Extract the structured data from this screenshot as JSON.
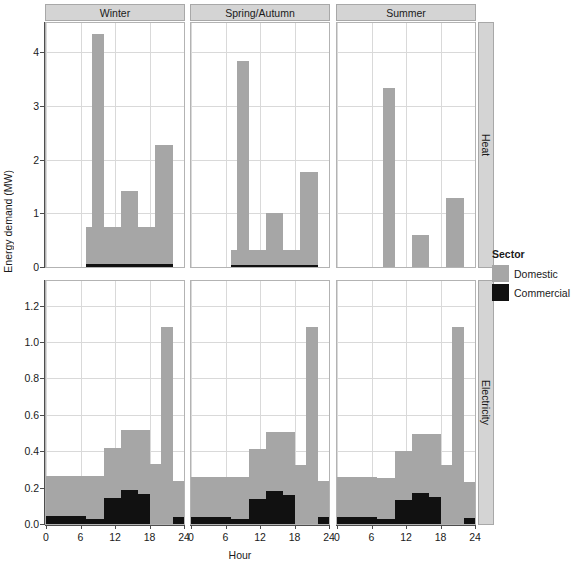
{
  "chart_data": {
    "type": "bar",
    "title": "",
    "xlabel": "Hour",
    "ylabel": "Energy demand (MW)",
    "grid": true,
    "legend": {
      "title": "Sector",
      "position": "right",
      "entries": [
        {
          "name": "Domestic",
          "color": "#a6a6a6"
        },
        {
          "name": "Commercial",
          "color": "#111111"
        }
      ]
    },
    "facet_columns": [
      "Winter",
      "Spring/Autumn",
      "Summer"
    ],
    "facet_rows": [
      "Heat",
      "Electricity"
    ],
    "x": [
      0,
      6,
      12,
      18,
      24
    ],
    "x_range": [
      0,
      24
    ],
    "panels": [
      {
        "row": "Heat",
        "col": "Winter",
        "ylim": [
          0,
          4.55
        ],
        "yticks": [
          0,
          1,
          2,
          3,
          4
        ],
        "series": [
          {
            "name": "Domestic",
            "color": "#a6a6a6",
            "steps": [
              {
                "x0": 0,
                "x1": 7,
                "value": 0.0
              },
              {
                "x0": 7,
                "x1": 8,
                "value": 0.75
              },
              {
                "x0": 8,
                "x1": 10,
                "value": 4.35
              },
              {
                "x0": 10,
                "x1": 13,
                "value": 0.75
              },
              {
                "x0": 13,
                "x1": 16,
                "value": 1.42
              },
              {
                "x0": 16,
                "x1": 19,
                "value": 0.75
              },
              {
                "x0": 19,
                "x1": 22,
                "value": 2.28
              },
              {
                "x0": 22,
                "x1": 24,
                "value": 0.0
              }
            ]
          },
          {
            "name": "Commercial",
            "color": "#111111",
            "steps": [
              {
                "x0": 0,
                "x1": 7,
                "value": 0.0
              },
              {
                "x0": 7,
                "x1": 22,
                "value": 0.06
              },
              {
                "x0": 22,
                "x1": 24,
                "value": 0.0
              }
            ]
          }
        ]
      },
      {
        "row": "Heat",
        "col": "Spring/Autumn",
        "ylim": [
          0,
          4.55
        ],
        "yticks": [
          0,
          1,
          2,
          3,
          4
        ],
        "series": [
          {
            "name": "Domestic",
            "color": "#a6a6a6",
            "steps": [
              {
                "x0": 0,
                "x1": 7,
                "value": 0.0
              },
              {
                "x0": 7,
                "x1": 8,
                "value": 0.32
              },
              {
                "x0": 8,
                "x1": 10,
                "value": 3.85
              },
              {
                "x0": 10,
                "x1": 13,
                "value": 0.32
              },
              {
                "x0": 13,
                "x1": 16,
                "value": 1.01
              },
              {
                "x0": 16,
                "x1": 19,
                "value": 0.32
              },
              {
                "x0": 19,
                "x1": 22,
                "value": 1.78
              },
              {
                "x0": 22,
                "x1": 24,
                "value": 0.0
              }
            ]
          },
          {
            "name": "Commercial",
            "color": "#111111",
            "steps": [
              {
                "x0": 0,
                "x1": 7,
                "value": 0.0
              },
              {
                "x0": 7,
                "x1": 22,
                "value": 0.045
              },
              {
                "x0": 22,
                "x1": 24,
                "value": 0.0
              }
            ]
          }
        ]
      },
      {
        "row": "Heat",
        "col": "Summer",
        "ylim": [
          0,
          4.55
        ],
        "yticks": [
          0,
          1,
          2,
          3,
          4
        ],
        "series": [
          {
            "name": "Domestic",
            "color": "#a6a6a6",
            "steps": [
              {
                "x0": 0,
                "x1": 8,
                "value": 0.0
              },
              {
                "x0": 8,
                "x1": 10,
                "value": 3.33
              },
              {
                "x0": 10,
                "x1": 13,
                "value": 0.0
              },
              {
                "x0": 13,
                "x1": 16,
                "value": 0.59
              },
              {
                "x0": 16,
                "x1": 19,
                "value": 0.0
              },
              {
                "x0": 19,
                "x1": 22,
                "value": 1.29
              },
              {
                "x0": 22,
                "x1": 24,
                "value": 0.0
              }
            ]
          },
          {
            "name": "Commercial",
            "color": "#111111",
            "steps": [
              {
                "x0": 0,
                "x1": 24,
                "value": 0.0
              }
            ]
          }
        ]
      },
      {
        "row": "Electricity",
        "col": "Winter",
        "ylim": [
          0,
          1.335
        ],
        "yticks": [
          0.0,
          0.2,
          0.4,
          0.6,
          0.8,
          1.0,
          1.2
        ],
        "series": [
          {
            "name": "Commercial",
            "color": "#111111",
            "steps": [
              {
                "x0": 0,
                "x1": 7,
                "value": 0.043
              },
              {
                "x0": 7,
                "x1": 10,
                "value": 0.029
              },
              {
                "x0": 10,
                "x1": 13,
                "value": 0.145
              },
              {
                "x0": 13,
                "x1": 16,
                "value": 0.185
              },
              {
                "x0": 16,
                "x1": 18,
                "value": 0.165
              },
              {
                "x0": 18,
                "x1": 22,
                "value": 0.186
              },
              {
                "x0": 22,
                "x1": 24,
                "value": 0.04
              }
            ]
          },
          {
            "name": "Domestic",
            "color": "#a6a6a6",
            "steps": [
              {
                "x0": 0,
                "x1": 7,
                "value": 0.223
              },
              {
                "x0": 7,
                "x1": 10,
                "value": 0.236
              },
              {
                "x0": 10,
                "x1": 13,
                "value": 0.275
              },
              {
                "x0": 13,
                "x1": 16,
                "value": 0.33
              },
              {
                "x0": 16,
                "x1": 18,
                "value": 0.35
              },
              {
                "x0": 18,
                "x1": 20,
                "value": 0.329
              },
              {
                "x0": 20,
                "x1": 22,
                "value": 1.084
              },
              {
                "x0": 22,
                "x1": 24,
                "value": 0.198
              }
            ]
          }
        ]
      },
      {
        "row": "Electricity",
        "col": "Spring/Autumn",
        "ylim": [
          0,
          1.335
        ],
        "yticks": [
          0.0,
          0.2,
          0.4,
          0.6,
          0.8,
          1.0,
          1.2
        ],
        "series": [
          {
            "name": "Commercial",
            "color": "#111111",
            "steps": [
              {
                "x0": 0,
                "x1": 7,
                "value": 0.04
              },
              {
                "x0": 7,
                "x1": 10,
                "value": 0.027
              },
              {
                "x0": 10,
                "x1": 13,
                "value": 0.138
              },
              {
                "x0": 13,
                "x1": 16,
                "value": 0.18
              },
              {
                "x0": 16,
                "x1": 18,
                "value": 0.158
              },
              {
                "x0": 18,
                "x1": 22,
                "value": 0.18
              },
              {
                "x0": 22,
                "x1": 24,
                "value": 0.037
              }
            ]
          },
          {
            "name": "Domestic",
            "color": "#a6a6a6",
            "steps": [
              {
                "x0": 0,
                "x1": 7,
                "value": 0.22
              },
              {
                "x0": 7,
                "x1": 10,
                "value": 0.233
              },
              {
                "x0": 10,
                "x1": 13,
                "value": 0.272
              },
              {
                "x0": 13,
                "x1": 16,
                "value": 0.325
              },
              {
                "x0": 16,
                "x1": 18,
                "value": 0.347
              },
              {
                "x0": 18,
                "x1": 20,
                "value": 0.325
              },
              {
                "x0": 20,
                "x1": 22,
                "value": 1.085
              },
              {
                "x0": 22,
                "x1": 24,
                "value": 0.197
              }
            ]
          }
        ]
      },
      {
        "row": "Electricity",
        "col": "Summer",
        "ylim": [
          0,
          1.335
        ],
        "yticks": [
          0.0,
          0.2,
          0.4,
          0.6,
          0.8,
          1.0,
          1.2
        ],
        "series": [
          {
            "name": "Commercial",
            "color": "#111111",
            "steps": [
              {
                "x0": 0,
                "x1": 7,
                "value": 0.038
              },
              {
                "x0": 7,
                "x1": 10,
                "value": 0.025
              },
              {
                "x0": 10,
                "x1": 13,
                "value": 0.133
              },
              {
                "x0": 13,
                "x1": 16,
                "value": 0.172
              },
              {
                "x0": 16,
                "x1": 18,
                "value": 0.15
              },
              {
                "x0": 18,
                "x1": 22,
                "value": 0.172
              },
              {
                "x0": 22,
                "x1": 24,
                "value": 0.035
              }
            ]
          },
          {
            "name": "Domestic",
            "color": "#a6a6a6",
            "steps": [
              {
                "x0": 0,
                "x1": 7,
                "value": 0.218
              },
              {
                "x0": 7,
                "x1": 10,
                "value": 0.23
              },
              {
                "x0": 10,
                "x1": 13,
                "value": 0.268
              },
              {
                "x0": 13,
                "x1": 16,
                "value": 0.322
              },
              {
                "x0": 16,
                "x1": 18,
                "value": 0.345
              },
              {
                "x0": 18,
                "x1": 20,
                "value": 0.322
              },
              {
                "x0": 20,
                "x1": 22,
                "value": 1.083
              },
              {
                "x0": 22,
                "x1": 24,
                "value": 0.195
              }
            ]
          }
        ]
      }
    ]
  },
  "axes": {
    "ylabel": "Energy demand (MW)",
    "xlabel": "Hour"
  },
  "legend": {
    "title": "Sector",
    "items": [
      {
        "label": "Domestic"
      },
      {
        "label": "Commercial"
      }
    ]
  },
  "strips": {
    "columns": [
      {
        "label": "Winter"
      },
      {
        "label": "Spring/Autumn"
      },
      {
        "label": "Summer"
      }
    ],
    "rows": [
      {
        "label": "Heat"
      },
      {
        "label": "Electricity"
      }
    ]
  }
}
